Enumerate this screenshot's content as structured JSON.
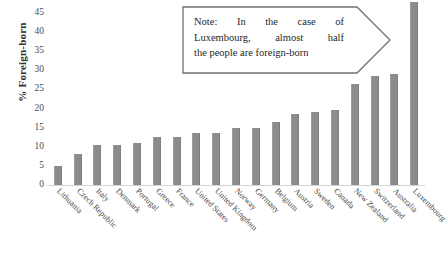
{
  "chart_data": {
    "type": "bar",
    "title": "",
    "xlabel": "",
    "ylabel": "% Foreign-born",
    "ylim": [
      0,
      45
    ],
    "yticks": [
      0,
      5,
      10,
      15,
      20,
      25,
      30,
      35,
      40,
      45
    ],
    "grid": false,
    "legend": "none",
    "bar_color": "#8c8c8c",
    "categories": [
      "Lithuania",
      "Czech Republic",
      "Italy",
      "Denmark",
      "Portugal",
      "Greece",
      "France",
      "United States",
      "United Kingdom",
      "Norway",
      "Germany",
      "Belgium",
      "Austria",
      "Sweden",
      "Canada",
      "New Zealand",
      "Switzerland",
      "Australia",
      "Luxembourg"
    ],
    "values": [
      5,
      8,
      10.5,
      10.5,
      11,
      12.5,
      12.5,
      13.5,
      13.5,
      15,
      15,
      16.5,
      18.5,
      19,
      19.5,
      26.5,
      28.5,
      29,
      48
    ],
    "annotations": [
      {
        "name": "luxembourg-note",
        "shape": "right-arrow-callout",
        "text": "Note: In the case of Luxembourg, almost half the people are foreign-born"
      }
    ]
  },
  "yaxis": {
    "title": "% Foreign-born",
    "ticks": [
      "0",
      "5",
      "10",
      "15",
      "20",
      "25",
      "30",
      "35",
      "40",
      "45"
    ]
  },
  "note": {
    "line1_words": [
      "Note:",
      "In",
      "the",
      "case",
      "of"
    ],
    "line2_words": [
      "Luxembourg,",
      "almost",
      "half"
    ],
    "line3": "the people are foreign-born"
  }
}
